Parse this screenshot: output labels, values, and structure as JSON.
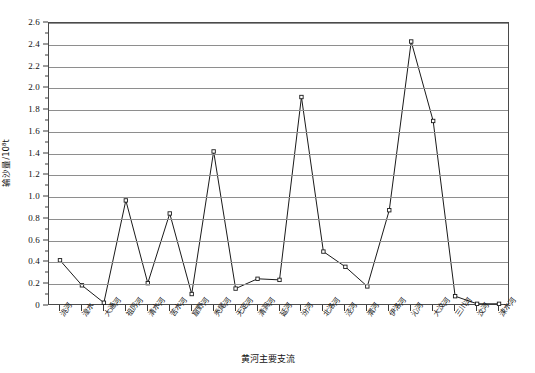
{
  "chart_data": {
    "type": "line",
    "title": "",
    "xlabel": "黄河主要支流",
    "ylabel": "输沙量/10⁸t",
    "ylim": [
      0,
      2.6
    ],
    "ytick_step": 0.2,
    "grid": true,
    "legend": "none",
    "marker": "open-square",
    "line_color": "#1a1a1a",
    "grid_color": "#8e8e8e",
    "categories": [
      "洮河",
      "祖厉河",
      "清水河",
      "苦水河",
      "都思兔河",
      "窟野河",
      "无定河",
      "清涧河",
      "延河",
      "汾河",
      "北洛河",
      "泾河",
      "渭河",
      "伊洛河",
      "沁河",
      "大汶河",
      "湟水",
      "大通河",
      "祖厉河",
      "秃尾河",
      "三川河"
    ],
    "ytick_labels": [
      "0",
      "0.2",
      "0.4",
      "0.6",
      "0.8",
      "1.0",
      "1.2",
      "1.4",
      "1.6",
      "1.8",
      "2.0",
      "2.2",
      "2.4",
      "2.6"
    ],
    "values": [
      0.42,
      0.19,
      0.03,
      0.97,
      0.21,
      0.85,
      0.11,
      1.42,
      0.16,
      0.25,
      0.24,
      1.92,
      0.5,
      0.36,
      0.18,
      0.88,
      2.43,
      1.7,
      0.09,
      0.02,
      0.02
    ],
    "x_labels_ordered": [
      "洮河",
      "湟水",
      "大通河",
      "祖厉河",
      "清水河",
      "苦水河",
      "窟野河",
      "秃尾河",
      "无定河",
      "清涧河",
      "延河",
      "汾河",
      "北洛河",
      "泾河",
      "渭河",
      "伊洛河",
      "沁河",
      "大汶河",
      "三川河",
      "汶河",
      "涑水河"
    ]
  },
  "axes": {
    "y_title": "输沙量/10⁸t",
    "x_title": "黄河主要支流"
  },
  "x_axis_categories": [
    "洮河",
    "湟水",
    "大通河",
    "祖厉河",
    "清水河",
    "苦水河",
    "窟野河",
    "秃尾河",
    "无定河",
    "清涧河",
    "三川河",
    "无定河",
    "清涧河",
    "延河",
    "汾河",
    "北洛河",
    "泾河",
    "渭河",
    "伊洛河",
    "沁河",
    "大汶河"
  ]
}
